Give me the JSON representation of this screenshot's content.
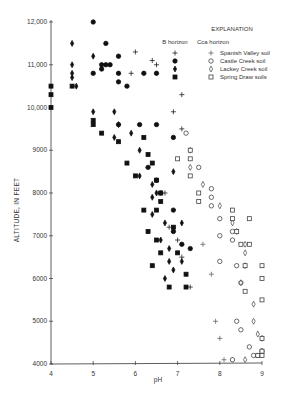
{
  "chart_data": {
    "type": "scatter",
    "title": "",
    "xlabel": "pH",
    "ylabel": "ALTITUDE, IN FEET",
    "xlim": [
      4,
      9
    ],
    "ylim": [
      4000,
      12000
    ],
    "xticks": [
      "4",
      "5",
      "6",
      "7",
      "8",
      "9"
    ],
    "yticks": [
      "4000",
      "5000",
      "6000",
      "7000",
      "8000",
      "9000",
      "10,000",
      "11,000",
      "12,000"
    ],
    "grid": false,
    "legend": {
      "title": "EXPLANATION",
      "column_headers": [
        "B horizon",
        "Cca horizon"
      ],
      "entries": [
        "Spanish Valley soil",
        "Castle Creek soil",
        "Lackey Creek soil",
        "Spring Draw soils"
      ],
      "position": "upper right"
    },
    "series": [
      {
        "name": "Spanish Valley soil - B horizon",
        "marker": "plus",
        "filled": true,
        "points": [
          [
            6.0,
            11.3
          ],
          [
            6.4,
            11.1
          ],
          [
            5.9,
            10.8
          ],
          [
            6.5,
            11.0
          ],
          [
            7.1,
            10.3
          ],
          [
            6.9,
            9.9
          ],
          [
            7.1,
            9.5
          ],
          [
            6.7,
            8.0
          ],
          [
            6.8,
            7.2
          ],
          [
            7.0,
            6.9
          ],
          [
            7.1,
            6.5
          ],
          [
            7.3,
            5.8
          ]
        ]
      },
      {
        "name": "Castle Creek soil - B horizon",
        "marker": "circle",
        "filled": true,
        "points": [
          [
            5.0,
            12.0
          ],
          [
            5.3,
            11.5
          ],
          [
            5.2,
            11.0
          ],
          [
            5.3,
            11.0
          ],
          [
            5.4,
            11.0
          ],
          [
            5.2,
            10.9
          ],
          [
            5.0,
            10.8
          ],
          [
            5.6,
            11.2
          ],
          [
            5.6,
            10.8
          ],
          [
            5.8,
            10.5
          ],
          [
            5.6,
            10.6
          ],
          [
            6.2,
            10.8
          ],
          [
            6.5,
            10.8
          ],
          [
            6.1,
            9.6
          ],
          [
            6.5,
            9.6
          ],
          [
            5.6,
            9.6
          ],
          [
            6.9,
            9.3
          ],
          [
            6.5,
            8.3
          ],
          [
            6.3,
            8.6
          ],
          [
            6.6,
            8.0
          ],
          [
            6.9,
            7.6
          ],
          [
            6.9,
            7.1
          ],
          [
            7.1,
            6.8
          ],
          [
            7.3,
            6.7
          ]
        ]
      },
      {
        "name": "Lackey Creek soil - B horizon",
        "marker": "diamond",
        "filled": true,
        "points": [
          [
            4.5,
            11.5
          ],
          [
            4.5,
            11.0
          ],
          [
            4.5,
            10.8
          ],
          [
            4.5,
            10.7
          ],
          [
            4.6,
            10.5
          ],
          [
            5.0,
            11.2
          ],
          [
            5.0,
            9.9
          ],
          [
            5.6,
            9.6
          ],
          [
            5.5,
            9.9
          ],
          [
            5.5,
            9.3
          ],
          [
            5.9,
            9.4
          ],
          [
            6.1,
            9.0
          ],
          [
            6.1,
            8.4
          ],
          [
            6.4,
            8.2
          ],
          [
            6.4,
            7.9
          ],
          [
            6.4,
            7.5
          ],
          [
            6.7,
            7.3
          ],
          [
            6.6,
            6.9
          ],
          [
            6.8,
            6.7
          ],
          [
            6.8,
            6.4
          ],
          [
            6.9,
            6.2
          ],
          [
            7.1,
            6.4
          ],
          [
            7.1,
            7.3
          ],
          [
            6.9,
            8.5
          ],
          [
            6.5,
            8.0
          ],
          [
            6.7,
            6.0
          ]
        ]
      },
      {
        "name": "Spring Draw soils - B horizon",
        "marker": "square",
        "filled": true,
        "points": [
          [
            4.0,
            10.5
          ],
          [
            4.0,
            10.3
          ],
          [
            4.0,
            10.0
          ],
          [
            4.5,
            10.5
          ],
          [
            5.0,
            9.7
          ],
          [
            5.0,
            9.6
          ],
          [
            5.2,
            9.4
          ],
          [
            5.6,
            9.2
          ],
          [
            5.8,
            8.7
          ],
          [
            6.0,
            8.4
          ],
          [
            6.2,
            9.3
          ],
          [
            6.3,
            8.9
          ],
          [
            6.4,
            8.7
          ],
          [
            6.5,
            8.3
          ],
          [
            6.6,
            8.0
          ],
          [
            6.6,
            7.8
          ],
          [
            6.2,
            7.6
          ],
          [
            6.5,
            7.6
          ],
          [
            6.3,
            7.1
          ],
          [
            6.5,
            6.9
          ],
          [
            6.6,
            6.6
          ],
          [
            6.4,
            6.3
          ],
          [
            6.9,
            7.2
          ],
          [
            7.0,
            6.6
          ],
          [
            7.2,
            6.1
          ],
          [
            7.2,
            5.8
          ],
          [
            6.8,
            5.8
          ]
        ]
      },
      {
        "name": "Spanish Valley soil - Cca horizon",
        "marker": "plus",
        "filled": false,
        "points": [
          [
            7.6,
            6.8
          ],
          [
            7.8,
            6.1
          ],
          [
            7.9,
            5.0
          ],
          [
            8.0,
            4.6
          ],
          [
            8.1,
            4.1
          ],
          [
            8.3,
            4.1
          ]
        ]
      },
      {
        "name": "Castle Creek soil - Cca horizon",
        "marker": "circle",
        "filled": false,
        "points": [
          [
            7.2,
            9.4
          ],
          [
            7.5,
            8.6
          ],
          [
            7.8,
            8.1
          ],
          [
            7.8,
            7.9
          ],
          [
            7.8,
            7.7
          ],
          [
            8.0,
            7.4
          ],
          [
            8.3,
            7.1
          ],
          [
            8.0,
            7.0
          ],
          [
            8.3,
            6.9
          ],
          [
            8.0,
            6.4
          ],
          [
            8.4,
            6.3
          ],
          [
            8.5,
            5.9
          ],
          [
            8.4,
            5.0
          ],
          [
            8.5,
            4.8
          ],
          [
            8.8,
            4.2
          ],
          [
            8.7,
            4.4
          ],
          [
            9.0,
            4.3
          ],
          [
            8.9,
            4.2
          ],
          [
            8.3,
            4.1
          ]
        ]
      },
      {
        "name": "Lackey Creek soil - Cca horizon",
        "marker": "diamond",
        "filled": false,
        "points": [
          [
            7.3,
            9.0
          ],
          [
            7.3,
            8.6
          ],
          [
            7.6,
            8.2
          ],
          [
            8.0,
            7.7
          ],
          [
            8.3,
            7.3
          ],
          [
            8.4,
            7.1
          ],
          [
            8.6,
            6.8
          ],
          [
            8.6,
            6.6
          ],
          [
            8.6,
            6.3
          ],
          [
            8.5,
            5.9
          ],
          [
            8.8,
            5.4
          ],
          [
            8.8,
            5.0
          ],
          [
            8.9,
            4.7
          ],
          [
            9.0,
            4.6
          ],
          [
            9.0,
            4.3
          ],
          [
            8.6,
            4.1
          ]
        ]
      },
      {
        "name": "Spring Draw soils - Cca horizon",
        "marker": "square",
        "filled": false,
        "points": [
          [
            7.0,
            8.8
          ],
          [
            7.3,
            9.0
          ],
          [
            7.3,
            8.8
          ],
          [
            7.3,
            8.4
          ],
          [
            7.5,
            8.0
          ],
          [
            7.5,
            7.8
          ],
          [
            8.3,
            7.6
          ],
          [
            8.3,
            7.4
          ],
          [
            8.7,
            7.4
          ],
          [
            8.5,
            6.8
          ],
          [
            8.7,
            6.8
          ],
          [
            8.6,
            6.3
          ],
          [
            9.0,
            6.3
          ],
          [
            9.0,
            6.0
          ],
          [
            9.0,
            5.5
          ],
          [
            8.6,
            5.7
          ],
          [
            9.0,
            4.6
          ],
          [
            9.0,
            4.3
          ],
          [
            8.9,
            4.2
          ],
          [
            9.0,
            4.2
          ],
          [
            8.4,
            7.1
          ]
        ]
      }
    ]
  }
}
